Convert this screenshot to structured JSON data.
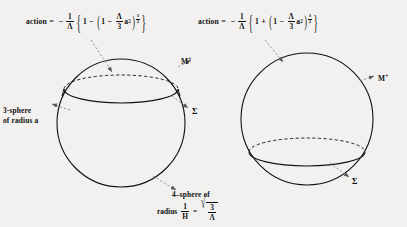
{
  "figure": {
    "background_color": "#f2f1ef",
    "ink_color": "#111111",
    "caption_note": "Two Euclidean four-sphere instanton diagrams with action formulas"
  },
  "equations": {
    "left": {
      "lhs": "action",
      "equals": "=",
      "sign": "−",
      "prefactor_num": "1",
      "prefactor_den": "Λ",
      "brace_open": "{",
      "first_term": "1",
      "operator": "−",
      "paren_open": "(",
      "inner_first": "1",
      "inner_operator": "−",
      "lambda_num": "Λ",
      "lambda_den": "3",
      "a_symbol": "a",
      "a_power": "2",
      "paren_close": ")",
      "exponent_num": "3",
      "exponent_den": "2",
      "brace_close": "}"
    },
    "right": {
      "lhs": "action",
      "equals": "=",
      "sign": "−",
      "prefactor_num": "1",
      "prefactor_den": "Λ",
      "brace_open": "{",
      "first_term": "1",
      "operator": "+",
      "paren_open": "(",
      "inner_first": "1",
      "inner_operator": "−",
      "lambda_num": "Λ",
      "lambda_den": "3",
      "a_symbol": "a",
      "a_power": "2",
      "paren_close": ")",
      "exponent_num": "3",
      "exponent_den": "2",
      "brace_close": "}"
    }
  },
  "labels": {
    "three_sphere": "3-sphere",
    "three_sphere_line2": "of radius a",
    "m_plus": "M",
    "m_plus_sup": "+",
    "sigma": "Σ",
    "four_sphere_line1": "4–sphere of",
    "radius_word": "radius",
    "radius_num": "1",
    "radius_den": "H",
    "radius_equals": "=",
    "sqrt_glyph": "√",
    "sqrt_num": "3",
    "sqrt_den": "Λ"
  },
  "diagrams": {
    "left": {
      "name": "small-cap-instanton",
      "circle": {
        "cx": 121,
        "cy": 123,
        "r": 64
      },
      "cut_ellipse": {
        "cx": 121,
        "cy": 89,
        "rx": 57,
        "ry": 14
      },
      "description": "four-sphere cut by a 3-sphere above the equator"
    },
    "right": {
      "name": "large-cap-instanton",
      "circle": {
        "cx": 307,
        "cy": 119,
        "r": 66
      },
      "cut_ellipse": {
        "cx": 307,
        "cy": 152,
        "rx": 58,
        "ry": 14
      },
      "description": "four-sphere cut by a 3-sphere below the equator"
    }
  }
}
